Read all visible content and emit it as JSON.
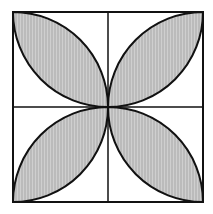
{
  "diagram": {
    "type": "geometry",
    "square": {
      "x": 13,
      "y": 12,
      "size": 190
    },
    "center": {
      "x": 108,
      "y": 107
    },
    "colors": {
      "stroke": "#111111",
      "fill": "#c4c4c4",
      "background": "#ffffff"
    },
    "petals": [
      {
        "quadrant": "top-left",
        "shaded": true
      },
      {
        "quadrant": "top-right",
        "shaded": true
      },
      {
        "quadrant": "bottom-left",
        "shaded": true
      },
      {
        "quadrant": "bottom-right",
        "shaded": true
      }
    ]
  }
}
